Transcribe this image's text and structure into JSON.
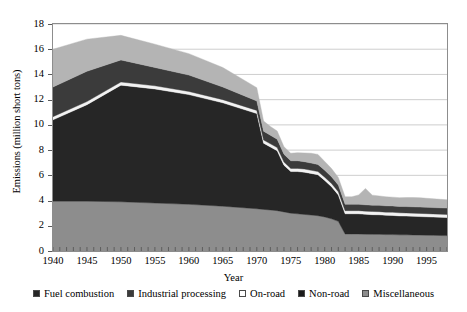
{
  "chart_data": {
    "type": "area",
    "stacked": true,
    "title": "",
    "xlabel": "Year",
    "ylabel": "Emissions (million short tons)",
    "xlim": [
      1940,
      1998
    ],
    "ylim": [
      0,
      18
    ],
    "ytick_labels": [
      "0",
      "2",
      "4",
      "6",
      "8",
      "10",
      "12",
      "14",
      "16",
      "18"
    ],
    "ytick_values": [
      0,
      2,
      4,
      6,
      8,
      10,
      12,
      14,
      16,
      18
    ],
    "xtick_labels": [
      "1940",
      "1945",
      "1950",
      "1955",
      "1960",
      "1965",
      "1970",
      "1975",
      "1980",
      "1985",
      "1990",
      "1995"
    ],
    "xtick_values": [
      1940,
      1945,
      1950,
      1955,
      1960,
      1965,
      1970,
      1975,
      1980,
      1985,
      1990,
      1995
    ],
    "grid": "horizontal",
    "legend_position": "bottom",
    "x": [
      1940,
      1945,
      1950,
      1955,
      1960,
      1965,
      1970,
      1971,
      1972,
      1973,
      1974,
      1975,
      1976,
      1977,
      1978,
      1979,
      1980,
      1981,
      1982,
      1983,
      1984,
      1985,
      1986,
      1987,
      1988,
      1989,
      1990,
      1991,
      1992,
      1993,
      1994,
      1995,
      1996,
      1997,
      1998
    ],
    "series": [
      {
        "name": "Fuel combustion",
        "color": "#8d8d8d",
        "values": [
          3.95,
          3.95,
          3.9,
          3.8,
          3.7,
          3.55,
          3.35,
          3.3,
          3.25,
          3.2,
          3.1,
          3.0,
          2.95,
          2.9,
          2.85,
          2.8,
          2.7,
          2.55,
          2.35,
          1.35,
          1.35,
          1.35,
          1.33,
          1.32,
          1.32,
          1.3,
          1.3,
          1.28,
          1.28,
          1.27,
          1.26,
          1.25,
          1.24,
          1.23,
          1.22
        ]
      },
      {
        "name": "Industrial processing",
        "color": "#262626",
        "values": [
          6.45,
          7.65,
          9.25,
          9.05,
          8.7,
          8.2,
          7.55,
          5.25,
          5.0,
          4.75,
          3.7,
          3.3,
          3.35,
          3.35,
          3.3,
          3.25,
          2.9,
          2.55,
          2.1,
          1.6,
          1.6,
          1.6,
          1.58,
          1.56,
          1.55,
          1.53,
          1.52,
          1.5,
          1.49,
          1.48,
          1.47,
          1.46,
          1.45,
          1.44,
          1.43
        ]
      },
      {
        "name": "On-road",
        "color": "#f2f2f2",
        "values": [
          0.25,
          0.25,
          0.25,
          0.25,
          0.25,
          0.25,
          0.25,
          0.25,
          0.25,
          0.25,
          0.25,
          0.25,
          0.25,
          0.25,
          0.25,
          0.25,
          0.25,
          0.25,
          0.25,
          0.25,
          0.25,
          0.25,
          0.25,
          0.25,
          0.25,
          0.25,
          0.25,
          0.25,
          0.25,
          0.25,
          0.25,
          0.25,
          0.25,
          0.25,
          0.25
        ]
      },
      {
        "name": "Non-road",
        "color": "#3b3b3b",
        "values": [
          2.35,
          2.4,
          1.75,
          1.45,
          1.3,
          1.0,
          0.75,
          0.7,
          0.68,
          0.66,
          0.62,
          0.6,
          0.6,
          0.58,
          0.57,
          0.56,
          0.55,
          0.54,
          0.53,
          0.5,
          0.5,
          0.5,
          0.5,
          0.5,
          0.5,
          0.5,
          0.5,
          0.5,
          0.5,
          0.5,
          0.5,
          0.5,
          0.5,
          0.5,
          0.5
        ]
      },
      {
        "name": "Miscellaneous",
        "color": "#b4b4b4",
        "values": [
          3.0,
          2.55,
          1.95,
          1.85,
          1.7,
          1.55,
          1.05,
          0.8,
          0.7,
          0.65,
          0.6,
          0.6,
          0.65,
          0.7,
          0.78,
          0.8,
          0.7,
          0.65,
          0.6,
          0.6,
          0.6,
          0.75,
          1.3,
          0.8,
          0.75,
          0.72,
          0.7,
          0.7,
          0.72,
          0.74,
          0.75,
          0.72,
          0.7,
          0.68,
          0.66
        ]
      }
    ]
  },
  "legend": {
    "items": [
      {
        "label": "Fuel combustion",
        "color": "#262626"
      },
      {
        "label": "Industrial processing",
        "color": "#3b3b3b"
      },
      {
        "label": "On-road",
        "color": "#ffffff"
      },
      {
        "label": "Non-road",
        "color": "#1a1a1a"
      },
      {
        "label": "Miscellaneous",
        "color": "#8d8d8d"
      }
    ]
  }
}
